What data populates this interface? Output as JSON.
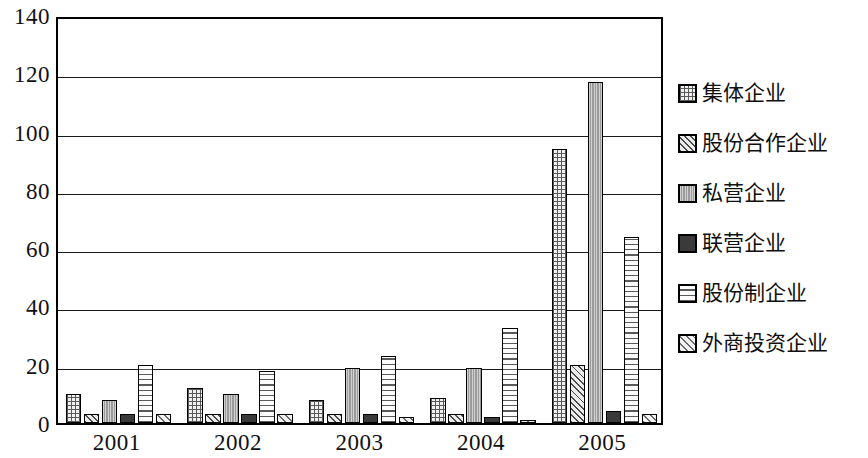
{
  "chart_data": {
    "type": "bar",
    "title": "",
    "xlabel": "",
    "ylabel": "",
    "ylim": [
      0,
      140
    ],
    "ytick_step": 20,
    "grid": true,
    "legend_position": "right",
    "categories": [
      "2001",
      "2002",
      "2003",
      "2004",
      "2005"
    ],
    "ytick_labels": [
      "140",
      "120",
      "100",
      "80",
      "60",
      "40",
      "20",
      "0"
    ],
    "ytick_values": [
      140,
      120,
      100,
      80,
      60,
      40,
      20,
      0
    ],
    "series": [
      {
        "name": "集体企业",
        "pattern": "grid-crosshatch",
        "values": [
          10,
          12,
          8,
          8.5,
          94
        ]
      },
      {
        "name": "股份合作企业",
        "pattern": "diagonal-hatch",
        "values": [
          3,
          3,
          3,
          3,
          20
        ]
      },
      {
        "name": "私营企业",
        "pattern": "dense-vertical",
        "values": [
          8,
          10,
          19,
          19,
          117
        ]
      },
      {
        "name": "联营企业",
        "pattern": "solid-dark",
        "values": [
          3,
          3,
          3,
          2,
          4
        ]
      },
      {
        "name": "股份制企业",
        "pattern": "horizontal-lines",
        "values": [
          20,
          18,
          23,
          32.5,
          64
        ]
      },
      {
        "name": "外商投资企业",
        "pattern": "diagonal-hatch-2",
        "values": [
          3,
          3,
          2,
          1.2,
          3
        ]
      }
    ]
  },
  "legend": {
    "items": [
      {
        "label": "集体企业"
      },
      {
        "label": "股份合作企业"
      },
      {
        "label": "私营企业"
      },
      {
        "label": "联营企业"
      },
      {
        "label": "股份制企业"
      },
      {
        "label": "外商投资企业"
      }
    ]
  },
  "colors": {
    "axis": "#000000",
    "gridline": "#1a1a1a",
    "background": "#ffffff",
    "text": "#111111"
  }
}
